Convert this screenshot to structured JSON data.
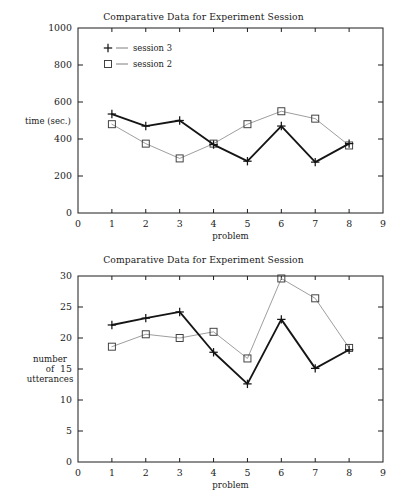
{
  "page": {
    "background": "#ffffff",
    "width": 407,
    "height": 504
  },
  "colors": {
    "session3_line": "#151515",
    "session2_line": "#8d8d8d",
    "frame": "#1d1d1d",
    "text": "#1a1a1a"
  },
  "charts": [
    {
      "id": "chart-1",
      "title": "Comparative Data for Experiment Session",
      "xlabel": "problem",
      "ylabel": "time (sec.)",
      "ylabel_lines": [
        "time (sec.)"
      ],
      "x_ticks": [
        "0",
        "1",
        "2",
        "3",
        "4",
        "5",
        "6",
        "7",
        "8",
        "9"
      ],
      "y_ticks": [
        "0",
        "200",
        "400",
        "600",
        "800",
        "1000"
      ],
      "legend": [
        {
          "marker": "plus-marker-icon",
          "label": "session 3"
        },
        {
          "marker": "square-marker-icon",
          "label": "session 2"
        }
      ]
    },
    {
      "id": "chart-2",
      "title": "Comparative Data for Experiment Session",
      "xlabel": "problem",
      "ylabel": "number of utterances",
      "ylabel_lines": [
        "number",
        "of",
        "utterances"
      ],
      "x_ticks": [
        "0",
        "1",
        "2",
        "3",
        "4",
        "5",
        "6",
        "7",
        "8",
        "9"
      ],
      "y_ticks": [
        "0",
        "5",
        "10",
        "15",
        "20",
        "25",
        "30"
      ],
      "legend": []
    }
  ],
  "chart_data": [
    {
      "type": "line",
      "title": "Comparative Data for Experiment Session",
      "xlabel": "problem",
      "ylabel": "time (sec.)",
      "x": [
        1,
        2,
        3,
        4,
        5,
        6,
        7,
        8
      ],
      "xlim": [
        0,
        9
      ],
      "ylim": [
        0,
        1000
      ],
      "xticks": [
        0,
        1,
        2,
        3,
        4,
        5,
        6,
        7,
        8,
        9
      ],
      "yticks": [
        0,
        200,
        400,
        600,
        800,
        1000
      ],
      "grid": false,
      "legend_position": "top-left-inside",
      "series": [
        {
          "name": "session 3",
          "marker": "plus",
          "values": [
            535,
            470,
            500,
            370,
            280,
            470,
            275,
            375
          ]
        },
        {
          "name": "session 2",
          "marker": "square",
          "values": [
            480,
            375,
            295,
            375,
            480,
            550,
            510,
            365
          ]
        }
      ]
    },
    {
      "type": "line",
      "title": "Comparative Data for Experiment Session",
      "xlabel": "problem",
      "ylabel": "number of utterances",
      "x": [
        1,
        2,
        3,
        4,
        5,
        6,
        7,
        8
      ],
      "xlim": [
        0,
        9
      ],
      "ylim": [
        0,
        30
      ],
      "xticks": [
        0,
        1,
        2,
        3,
        4,
        5,
        6,
        7,
        8,
        9
      ],
      "yticks": [
        0,
        5,
        10,
        15,
        20,
        25,
        30
      ],
      "grid": false,
      "legend_position": "none",
      "series": [
        {
          "name": "session 3",
          "marker": "plus",
          "values": [
            22.1,
            23.2,
            24.2,
            17.7,
            12.6,
            23.0,
            15.1,
            18.1
          ]
        },
        {
          "name": "session 2",
          "marker": "square",
          "values": [
            18.6,
            20.6,
            20.0,
            21.0,
            16.7,
            29.6,
            26.4,
            18.4
          ]
        }
      ]
    }
  ]
}
